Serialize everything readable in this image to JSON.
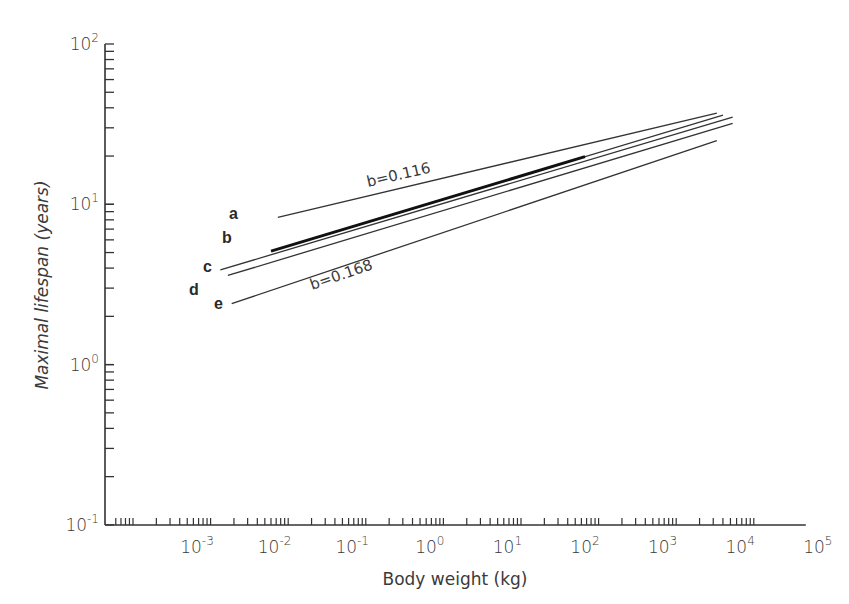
{
  "chart_data": {
    "type": "line",
    "title": "",
    "xlabel": "Body weight (kg)",
    "ylabel": "Maximal lifespan (years)",
    "xscale": "log",
    "yscale": "log",
    "xlim": [
      0.0001,
      100000
    ],
    "ylim": [
      0.1,
      100
    ],
    "grid": false,
    "legend": "inline letter labels at left end of each line",
    "x_tick_labels": [
      {
        "base": "10",
        "exp": "-3"
      },
      {
        "base": "10",
        "exp": "-2"
      },
      {
        "base": "10",
        "exp": "-1"
      },
      {
        "base": "10",
        "exp": "0"
      },
      {
        "base": "10",
        "exp": "1"
      },
      {
        "base": "10",
        "exp": "2"
      },
      {
        "base": "10",
        "exp": "3"
      },
      {
        "base": "10",
        "exp": "4"
      },
      {
        "base": "10",
        "exp": "5"
      }
    ],
    "y_tick_labels": [
      {
        "base": "10",
        "exp": "2"
      },
      {
        "base": "10",
        "exp": "1"
      },
      {
        "base": "10",
        "exp": "0"
      },
      {
        "base": "10",
        "exp": "-1"
      }
    ],
    "series": [
      {
        "name": "a",
        "x": [
          0.011,
          5000
        ],
        "y": [
          8.3,
          37
        ]
      },
      {
        "name": "b",
        "x": [
          0.009,
          6000
        ],
        "y": [
          5.1,
          36
        ],
        "note": "thick segment from ~0.009 to ~100 kg"
      },
      {
        "name": "c",
        "x": [
          0.002,
          8000
        ],
        "y": [
          3.9,
          35
        ]
      },
      {
        "name": "d",
        "x": [
          0.0025,
          8000
        ],
        "y": [
          3.6,
          32
        ]
      },
      {
        "name": "e",
        "x": [
          0.0028,
          5000
        ],
        "y": [
          2.4,
          25
        ]
      }
    ],
    "annotations": [
      {
        "text": "b=0.116",
        "near_series": "a"
      },
      {
        "text": "b=0.168",
        "near_series": "e"
      }
    ]
  }
}
